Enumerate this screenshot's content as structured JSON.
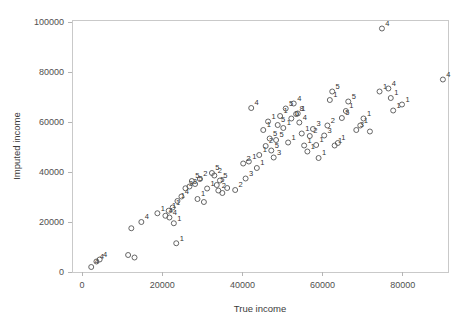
{
  "chart": {
    "type": "scatter",
    "title": "",
    "xlabel": "True income",
    "ylabel": "Imputed income",
    "xlim": [
      0,
      92000
    ],
    "ylim": [
      0,
      104000
    ],
    "grid": false,
    "legend": false,
    "marker": "open-circle",
    "point_label_field": "label"
  },
  "axes": {
    "x": {
      "label": "True income",
      "ticks": [
        0,
        20000,
        40000,
        60000,
        80000
      ],
      "tick_labels": [
        "0",
        "20000",
        "40000",
        "60000",
        "80000"
      ]
    },
    "y": {
      "label": "Imputed income",
      "ticks": [
        0,
        20000,
        40000,
        60000,
        80000,
        100000
      ],
      "tick_labels": [
        "0",
        "20000",
        "40000",
        "60000",
        "80000",
        "100000"
      ]
    }
  },
  "colors": {
    "marker_stroke": "#555555",
    "label_text": "#333333",
    "axis": "#c9c9c9",
    "tick_text": "#4f4f4f",
    "background": "#ffffff"
  },
  "chart_data": {
    "type": "scatter",
    "title": "",
    "xlabel": "True income",
    "ylabel": "Imputed income",
    "xlim": [
      0,
      92000
    ],
    "ylim": [
      0,
      104000
    ],
    "grid": false,
    "legend": false,
    "x_ticks": [
      0,
      20000,
      40000,
      60000,
      80000
    ],
    "y_ticks": [
      0,
      20000,
      40000,
      60000,
      80000,
      100000
    ],
    "series": [
      {
        "name": "imputations",
        "marker": "open-circle",
        "points": [
          {
            "x": 2300,
            "y": 2000,
            "label": "4"
          },
          {
            "x": 3600,
            "y": 4200,
            "label": "4"
          },
          {
            "x": 4400,
            "y": 5000,
            "label": "4"
          },
          {
            "x": 11500,
            "y": 6800,
            "label": ""
          },
          {
            "x": 12300,
            "y": 17500,
            "label": ""
          },
          {
            "x": 13100,
            "y": 5800,
            "label": ""
          },
          {
            "x": 14800,
            "y": 20000,
            "label": "4"
          },
          {
            "x": 18800,
            "y": 23500,
            "label": "1"
          },
          {
            "x": 20800,
            "y": 22500,
            "label": "4"
          },
          {
            "x": 21600,
            "y": 24500,
            "label": "1"
          },
          {
            "x": 21800,
            "y": 21800,
            "label": "4"
          },
          {
            "x": 22600,
            "y": 25800,
            "label": "1"
          },
          {
            "x": 22900,
            "y": 19500,
            "label": "1"
          },
          {
            "x": 23500,
            "y": 11500,
            "label": "1"
          },
          {
            "x": 23800,
            "y": 28400,
            "label": "1"
          },
          {
            "x": 24800,
            "y": 30200,
            "label": "4"
          },
          {
            "x": 25800,
            "y": 33500,
            "label": "3"
          },
          {
            "x": 26800,
            "y": 34200,
            "label": "3"
          },
          {
            "x": 27400,
            "y": 36400,
            "label": "5"
          },
          {
            "x": 28200,
            "y": 35200,
            "label": "5"
          },
          {
            "x": 28800,
            "y": 29200,
            "label": "1"
          },
          {
            "x": 29400,
            "y": 37200,
            "label": "2"
          },
          {
            "x": 30400,
            "y": 28000,
            "label": ""
          },
          {
            "x": 31200,
            "y": 33400,
            "label": "1"
          },
          {
            "x": 32400,
            "y": 39600,
            "label": "5"
          },
          {
            "x": 33000,
            "y": 38600,
            "label": "2"
          },
          {
            "x": 33600,
            "y": 34800,
            "label": "5"
          },
          {
            "x": 34000,
            "y": 32600,
            "label": "2"
          },
          {
            "x": 34400,
            "y": 36600,
            "label": "5"
          },
          {
            "x": 35000,
            "y": 31600,
            "label": ""
          },
          {
            "x": 36200,
            "y": 33600,
            "label": ""
          },
          {
            "x": 38200,
            "y": 32800,
            "label": "2"
          },
          {
            "x": 40200,
            "y": 43400,
            "label": "2"
          },
          {
            "x": 40800,
            "y": 37400,
            "label": "3"
          },
          {
            "x": 41600,
            "y": 44200,
            "label": "1"
          },
          {
            "x": 42200,
            "y": 65600,
            "label": "4"
          },
          {
            "x": 43600,
            "y": 41600,
            "label": "1"
          },
          {
            "x": 44200,
            "y": 46800,
            "label": "1"
          },
          {
            "x": 45200,
            "y": 56800,
            "label": "1"
          },
          {
            "x": 45800,
            "y": 50400,
            "label": "2"
          },
          {
            "x": 46400,
            "y": 60200,
            "label": "1"
          },
          {
            "x": 46800,
            "y": 53400,
            "label": "5"
          },
          {
            "x": 47200,
            "y": 48600,
            "label": "5"
          },
          {
            "x": 47800,
            "y": 45800,
            "label": "3"
          },
          {
            "x": 48400,
            "y": 52800,
            "label": "5"
          },
          {
            "x": 48800,
            "y": 58800,
            "label": "5"
          },
          {
            "x": 49400,
            "y": 62400,
            "label": "1"
          },
          {
            "x": 50200,
            "y": 57600,
            "label": "1"
          },
          {
            "x": 50800,
            "y": 65400,
            "label": "5"
          },
          {
            "x": 51400,
            "y": 51800,
            "label": "1"
          },
          {
            "x": 52200,
            "y": 61400,
            "label": "1"
          },
          {
            "x": 52800,
            "y": 67400,
            "label": "4"
          },
          {
            "x": 53400,
            "y": 63200,
            "label": "8"
          },
          {
            "x": 53800,
            "y": 63400,
            "label": "1"
          },
          {
            "x": 54200,
            "y": 59800,
            "label": "4"
          },
          {
            "x": 54800,
            "y": 55400,
            "label": "1"
          },
          {
            "x": 55400,
            "y": 50600,
            "label": "1"
          },
          {
            "x": 56200,
            "y": 48200,
            "label": "1"
          },
          {
            "x": 56800,
            "y": 54400,
            "label": "2"
          },
          {
            "x": 57600,
            "y": 57200,
            "label": "3"
          },
          {
            "x": 58400,
            "y": 50800,
            "label": "1"
          },
          {
            "x": 59000,
            "y": 45600,
            "label": "1"
          },
          {
            "x": 60400,
            "y": 54600,
            "label": "3"
          },
          {
            "x": 61200,
            "y": 58600,
            "label": "2"
          },
          {
            "x": 61800,
            "y": 68800,
            "label": "1"
          },
          {
            "x": 62400,
            "y": 72200,
            "label": "5"
          },
          {
            "x": 63000,
            "y": 50600,
            "label": "1"
          },
          {
            "x": 63800,
            "y": 51600,
            "label": "1"
          },
          {
            "x": 64800,
            "y": 61600,
            "label": "5"
          },
          {
            "x": 65800,
            "y": 64400,
            "label": "1"
          },
          {
            "x": 66400,
            "y": 68200,
            "label": "5"
          },
          {
            "x": 68400,
            "y": 56800,
            "label": "3"
          },
          {
            "x": 69400,
            "y": 58600,
            "label": "1"
          },
          {
            "x": 70200,
            "y": 61400,
            "label": "1"
          },
          {
            "x": 71800,
            "y": 56200,
            "label": ""
          },
          {
            "x": 74200,
            "y": 72200,
            "label": "1"
          },
          {
            "x": 74800,
            "y": 97400,
            "label": "4"
          },
          {
            "x": 76400,
            "y": 73400,
            "label": "4"
          },
          {
            "x": 77000,
            "y": 69600,
            "label": "1"
          },
          {
            "x": 77600,
            "y": 64600,
            "label": "1"
          },
          {
            "x": 79800,
            "y": 67000,
            "label": "1"
          },
          {
            "x": 90000,
            "y": 77000,
            "label": "4"
          }
        ]
      }
    ]
  }
}
